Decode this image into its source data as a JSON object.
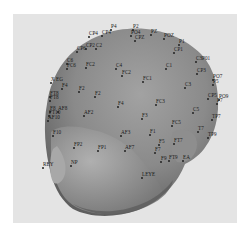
{
  "figure": {
    "colors": {
      "page_bg": "#ffffff",
      "panel_bg": "#e4e4e4",
      "scalp_light": "#9a9a9a",
      "scalp_mid": "#7d7d7d",
      "scalp_dark": "#5a5a5a",
      "face_light": "#b0b0b0",
      "label_text": "#1a1a1a"
    },
    "electrodes": [
      {
        "label": "P4",
        "x": 98,
        "y": 10
      },
      {
        "label": "CP4",
        "x": 89,
        "y": 16
      },
      {
        "label": "CP4",
        "x": 76,
        "y": 17
      },
      {
        "label": "P2",
        "x": 120,
        "y": 10
      },
      {
        "label": "PO4",
        "x": 118,
        "y": 16
      },
      {
        "label": "CPZ",
        "x": 122,
        "y": 21
      },
      {
        "label": "PZ",
        "x": 138,
        "y": 15
      },
      {
        "label": "POZ",
        "x": 151,
        "y": 19
      },
      {
        "label": "P1",
        "x": 166,
        "y": 25
      },
      {
        "label": "CP1",
        "x": 161,
        "y": 33
      },
      {
        "label": "CP2",
        "x": 73,
        "y": 29
      },
      {
        "label": "CP6",
        "x": 64,
        "y": 32
      },
      {
        "label": "C2",
        "x": 83,
        "y": 29
      },
      {
        "label": "C6",
        "x": 54,
        "y": 44
      },
      {
        "label": "FC6",
        "x": 54,
        "y": 49
      },
      {
        "label": "FC2",
        "x": 73,
        "y": 48
      },
      {
        "label": "C4",
        "x": 103,
        "y": 49
      },
      {
        "label": "C1",
        "x": 153,
        "y": 49
      },
      {
        "label": "FC2",
        "x": 109,
        "y": 56
      },
      {
        "label": "C3P01",
        "x": 183,
        "y": 42
      },
      {
        "label": "CP3",
        "x": 184,
        "y": 54
      },
      {
        "label": "FC1",
        "x": 130,
        "y": 62
      },
      {
        "label": "C3",
        "x": 172,
        "y": 68
      },
      {
        "label": "PO7",
        "x": 200,
        "y": 60
      },
      {
        "label": "P5",
        "x": 200,
        "y": 65
      },
      {
        "label": "X EG",
        "x": 38,
        "y": 63
      },
      {
        "label": "F4",
        "x": 49,
        "y": 69
      },
      {
        "label": "F2",
        "x": 66,
        "y": 72
      },
      {
        "label": "F2",
        "x": 82,
        "y": 77
      },
      {
        "label": "FT8",
        "x": 37,
        "y": 77
      },
      {
        "label": "FT8",
        "x": 37,
        "y": 81
      },
      {
        "label": "F4",
        "x": 105,
        "y": 87
      },
      {
        "label": "FC3",
        "x": 143,
        "y": 85
      },
      {
        "label": "CP5",
        "x": 195,
        "y": 79
      },
      {
        "label": "PO9",
        "x": 206,
        "y": 80
      },
      {
        "label": "P7",
        "x": 204,
        "y": 84
      },
      {
        "label": "F8",
        "x": 37,
        "y": 92
      },
      {
        "label": "AF8",
        "x": 45,
        "y": 92
      },
      {
        "label": "FT10",
        "x": 36,
        "y": 96
      },
      {
        "label": "AF10",
        "x": 35,
        "y": 101
      },
      {
        "label": "AF2",
        "x": 71,
        "y": 96
      },
      {
        "label": "C5",
        "x": 180,
        "y": 93
      },
      {
        "label": "TP7",
        "x": 199,
        "y": 100
      },
      {
        "label": "F3",
        "x": 129,
        "y": 99
      },
      {
        "label": "FC5",
        "x": 159,
        "y": 106
      },
      {
        "label": "F10",
        "x": 40,
        "y": 116
      },
      {
        "label": "AF3",
        "x": 108,
        "y": 116
      },
      {
        "label": "F1",
        "x": 137,
        "y": 115
      },
      {
        "label": "T7",
        "x": 185,
        "y": 112
      },
      {
        "label": "TP9",
        "x": 195,
        "y": 118
      },
      {
        "label": "F5",
        "x": 146,
        "y": 125
      },
      {
        "label": "FT7",
        "x": 161,
        "y": 124
      },
      {
        "label": "FP2",
        "x": 61,
        "y": 128
      },
      {
        "label": "FP1",
        "x": 85,
        "y": 131
      },
      {
        "label": "AF7",
        "x": 112,
        "y": 131
      },
      {
        "label": "F7",
        "x": 142,
        "y": 133
      },
      {
        "label": "REY",
        "x": 30,
        "y": 148
      },
      {
        "label": "NP",
        "x": 58,
        "y": 146
      },
      {
        "label": "FT9",
        "x": 156,
        "y": 141
      },
      {
        "label": "EA",
        "x": 170,
        "y": 141
      },
      {
        "label": "F9",
        "x": 148,
        "y": 142
      },
      {
        "label": "LEYE",
        "x": 129,
        "y": 158
      }
    ]
  }
}
